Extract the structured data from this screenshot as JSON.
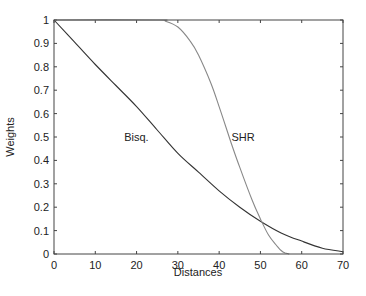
{
  "chart_data": {
    "type": "line",
    "title": "",
    "xlabel": "Distances",
    "ylabel": "Weights",
    "xlim": [
      0,
      70
    ],
    "ylim": [
      0,
      1
    ],
    "grid": false,
    "legend": null,
    "xticks": [
      0,
      10,
      20,
      30,
      40,
      50,
      60,
      70
    ],
    "yticks": [
      0,
      0.1,
      0.2,
      0.3,
      0.4,
      0.5,
      0.6,
      0.7,
      0.8,
      0.9,
      1
    ],
    "xtick_labels": [
      "0",
      "10",
      "20",
      "30",
      "40",
      "50",
      "60",
      "70"
    ],
    "ytick_labels": [
      "0",
      "0.1",
      "0.2",
      "0.3",
      "0.4",
      "0.5",
      "0.6",
      "0.7",
      "0.8",
      "0.9",
      "1"
    ],
    "series": [
      {
        "name": "Bisq.",
        "color": "#333333",
        "x": [
          0,
          5,
          10,
          15,
          20,
          25,
          30,
          35,
          40,
          45,
          50,
          55,
          60,
          65,
          70
        ],
        "y": [
          1.0,
          0.905,
          0.81,
          0.72,
          0.63,
          0.53,
          0.43,
          0.35,
          0.27,
          0.2,
          0.14,
          0.09,
          0.055,
          0.025,
          0.01
        ]
      },
      {
        "name": "SHR",
        "color": "#888888",
        "x": [
          0,
          25,
          27,
          30,
          33,
          35,
          38,
          40,
          43,
          45,
          48,
          50,
          52,
          54,
          55,
          56,
          57
        ],
        "y": [
          1.0,
          1.0,
          0.995,
          0.97,
          0.91,
          0.85,
          0.73,
          0.63,
          0.47,
          0.37,
          0.23,
          0.15,
          0.08,
          0.035,
          0.015,
          0.004,
          0.0
        ]
      }
    ],
    "annotations": [
      {
        "text": "Bisq.",
        "x": 17,
        "y": 0.5
      },
      {
        "text": "SHR",
        "x": 43,
        "y": 0.5
      }
    ]
  }
}
